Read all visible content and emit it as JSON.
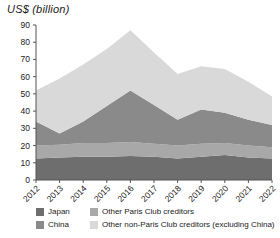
{
  "chart_data": {
    "type": "area",
    "stacked": true,
    "title": "US$ (billion)",
    "xlabel": "",
    "ylabel": "US$ (billion)",
    "ylim": [
      0,
      90
    ],
    "ytick_step": 10,
    "yticks": [
      0,
      10,
      20,
      30,
      40,
      50,
      60,
      70,
      80,
      90
    ],
    "grid": false,
    "legend_position": "bottom",
    "categories": [
      "2012",
      "2013",
      "2014",
      "2015",
      "2016",
      "2017",
      "2018",
      "2019",
      "2020",
      "2021",
      "2022"
    ],
    "series": [
      {
        "name": "Japan",
        "color": "#6e6e6e",
        "values": [
          12.5,
          13.0,
          13.5,
          13.5,
          14.0,
          13.5,
          12.5,
          13.5,
          14.5,
          13.0,
          12.5
        ]
      },
      {
        "name": "Other Paris Club creditors",
        "color": "#a8a8a8",
        "values": [
          7.5,
          7.5,
          8.0,
          8.0,
          8.0,
          7.5,
          7.5,
          7.5,
          7.0,
          7.0,
          6.5
        ]
      },
      {
        "name": "China",
        "color": "#8a8a8a",
        "values": [
          14.0,
          6.5,
          12.5,
          21.5,
          30.0,
          22.5,
          15.0,
          20.0,
          17.5,
          15.0,
          13.0
        ]
      },
      {
        "name": "Other non-Paris Club creditors (excluding China)",
        "color": "#d9d9d9",
        "values": [
          18.0,
          32.0,
          33.0,
          33.0,
          35.0,
          30.5,
          26.5,
          25.0,
          25.5,
          22.0,
          16.5
        ]
      }
    ],
    "totals": [
      52.0,
      59.0,
      67.0,
      76.0,
      87.0,
      74.0,
      61.5,
      66.0,
      64.5,
      57.0,
      48.5
    ]
  },
  "legend": {
    "items": [
      {
        "label": "Japan",
        "color": "#6e6e6e"
      },
      {
        "label": "Other Paris Club creditors",
        "color": "#a8a8a8"
      },
      {
        "label": "China",
        "color": "#8a8a8a"
      },
      {
        "label": "Other non-Paris Club creditors (excluding China)",
        "color": "#d9d9d9"
      }
    ]
  }
}
